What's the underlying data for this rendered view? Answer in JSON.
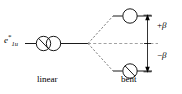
{
  "figure": {
    "type": "walsh-correlation-diagram",
    "background_color": "#ffffff",
    "line_color": "#000000",
    "dashed_color": "#666666"
  },
  "labels": {
    "orbital": {
      "base": "e",
      "superscript": "*",
      "subscript": "1u",
      "full": "e*1u"
    },
    "upper_split": {
      "sign": "+",
      "symbol": "β",
      "full": "+β"
    },
    "lower_split": {
      "sign": "−",
      "symbol": "β",
      "full": "−β"
    },
    "left_geometry": "linear",
    "right_geometry": "bent"
  },
  "levels": [
    {
      "name": "degenerate-e1u-level",
      "side": "left",
      "geometry": "linear",
      "energy_offset": 0,
      "degeneracy": 2,
      "orbitals": [
        {
          "name": "orbital-left-a",
          "occupied": true,
          "marker": "slash"
        },
        {
          "name": "orbital-left-b",
          "occupied": false,
          "marker": "empty"
        }
      ]
    },
    {
      "name": "upper-split-level",
      "side": "right",
      "geometry": "bent",
      "energy_offset": "+β",
      "degeneracy": 1,
      "orbitals": [
        {
          "name": "orbital-upper-right",
          "occupied": false,
          "marker": "empty"
        }
      ]
    },
    {
      "name": "lower-split-level",
      "side": "right",
      "geometry": "bent",
      "energy_offset": "−β",
      "degeneracy": 1,
      "orbitals": [
        {
          "name": "orbital-lower-right",
          "occupied": true,
          "marker": "slash"
        }
      ]
    }
  ],
  "connectors": {
    "upper_correlation": {
      "style": "dashed",
      "from": "linear-level",
      "to": "upper-split-level"
    },
    "lower_correlation": {
      "style": "dashed",
      "from": "linear-level",
      "to": "lower-split-level"
    },
    "reference_line": {
      "style": "dashed",
      "description": "zero-energy reference extending right"
    }
  },
  "energy_arrow": {
    "name": "splitting-arrow",
    "style": "double-headed-vertical",
    "spans": [
      "upper-split-level",
      "lower-split-level"
    ],
    "midpoint_tick": true
  }
}
